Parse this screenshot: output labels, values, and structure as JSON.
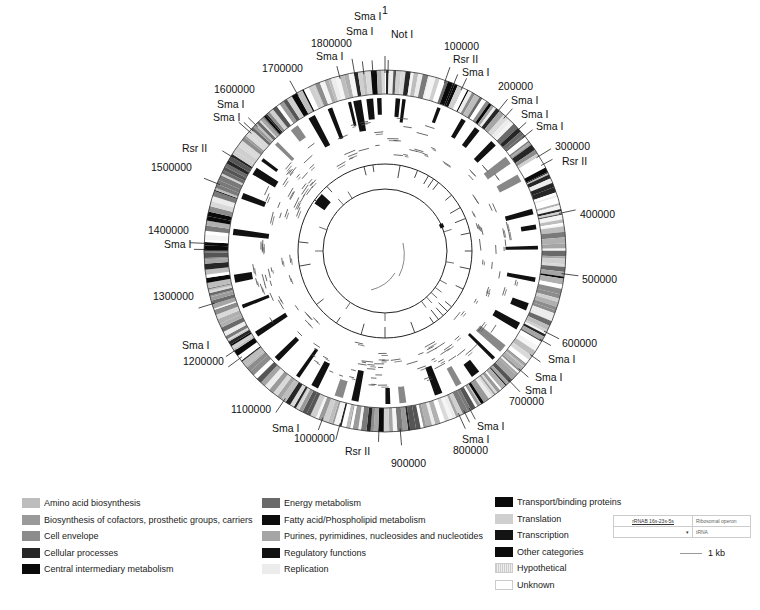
{
  "chart_data": {
    "type": "circular_genome_map",
    "genome_length_ticks": [
      "1",
      "100000",
      "200000",
      "300000",
      "400000",
      "500000",
      "600000",
      "700000",
      "800000",
      "900000",
      "1000000",
      "1100000",
      "1200000",
      "1300000",
      "1400000",
      "1500000",
      "1600000",
      "1700000",
      "1800000"
    ],
    "restriction_sites": [
      {
        "label": "Not I",
        "position": 5000
      },
      {
        "label": "Sma I",
        "position": 1830000
      },
      {
        "label": "Sma I",
        "position": 1815000
      },
      {
        "label": "Sma I",
        "position": 1775000
      },
      {
        "label": "Rsr II",
        "position": 115000
      },
      {
        "label": "Sma I",
        "position": 130000
      },
      {
        "label": "Sma I",
        "position": 215000
      },
      {
        "label": "Sma I",
        "position": 245000
      },
      {
        "label": "Sma I",
        "position": 260000
      },
      {
        "label": "Rsr II",
        "position": 315000
      },
      {
        "label": "Sma I",
        "position": 615000
      },
      {
        "label": "Sma I",
        "position": 645000
      },
      {
        "label": "Sma I",
        "position": 675000
      },
      {
        "label": "Sma I",
        "position": 790000
      },
      {
        "label": "Sma I",
        "position": 780000
      },
      {
        "label": "Rsr II",
        "position": 935000
      },
      {
        "label": "Sma I",
        "position": 1030000
      },
      {
        "label": "Sma I",
        "position": 1215000
      },
      {
        "label": "Sma I",
        "position": 1390000
      },
      {
        "label": "Rsr II",
        "position": 1550000
      },
      {
        "label": "Sma I",
        "position": 1615000
      },
      {
        "label": "Sma I",
        "position": 1605000
      }
    ],
    "rings": [
      "gene functional categories (outer)",
      "selected categories",
      "gene clusters",
      "rRNA/tRNA",
      "inner scale"
    ]
  },
  "labels": {
    "ticks": [
      {
        "text": "1",
        "x": 382,
        "y": 14
      },
      {
        "text": "100000",
        "x": 444,
        "y": 50
      },
      {
        "text": "200000",
        "x": 498,
        "y": 90
      },
      {
        "text": "300000",
        "x": 555,
        "y": 150
      },
      {
        "text": "400000",
        "x": 580,
        "y": 218
      },
      {
        "text": "500000",
        "x": 582,
        "y": 283
      },
      {
        "text": "600000",
        "x": 562,
        "y": 347
      },
      {
        "text": "700000",
        "x": 509,
        "y": 405
      },
      {
        "text": "800000",
        "x": 453,
        "y": 454
      },
      {
        "text": "900000",
        "x": 391,
        "y": 467
      },
      {
        "text": "1000000",
        "x": 294,
        "y": 442
      },
      {
        "text": "1100000",
        "x": 231,
        "y": 413
      },
      {
        "text": "1200000",
        "x": 183,
        "y": 365
      },
      {
        "text": "1300000",
        "x": 153,
        "y": 300
      },
      {
        "text": "1400000",
        "x": 148,
        "y": 234
      },
      {
        "text": "1500000",
        "x": 151,
        "y": 171
      },
      {
        "text": "1600000",
        "x": 214,
        "y": 93
      },
      {
        "text": "1700000",
        "x": 262,
        "y": 72
      },
      {
        "text": "1800000",
        "x": 311,
        "y": 47
      }
    ],
    "sites": [
      {
        "text": "Sma I",
        "x": 354,
        "y": 20
      },
      {
        "text": "Sma I",
        "x": 346,
        "y": 35
      },
      {
        "text": "Not I",
        "x": 391,
        "y": 38
      },
      {
        "text": "Sma I",
        "x": 316,
        "y": 60
      },
      {
        "text": "Rsr II",
        "x": 453,
        "y": 63
      },
      {
        "text": "Sma I",
        "x": 462,
        "y": 76
      },
      {
        "text": "Sma I",
        "x": 511,
        "y": 104
      },
      {
        "text": "Sma I",
        "x": 521,
        "y": 118
      },
      {
        "text": "Sma I",
        "x": 536,
        "y": 130
      },
      {
        "text": "Rsr II",
        "x": 562,
        "y": 165
      },
      {
        "text": "Sma I",
        "x": 164,
        "y": 248
      },
      {
        "text": "Sma I",
        "x": 182,
        "y": 349
      },
      {
        "text": "Sma I",
        "x": 548,
        "y": 363
      },
      {
        "text": "Sma I",
        "x": 535,
        "y": 381
      },
      {
        "text": "Sma I",
        "x": 525,
        "y": 394
      },
      {
        "text": "Sma I",
        "x": 477,
        "y": 430
      },
      {
        "text": "Sma I",
        "x": 462,
        "y": 443
      },
      {
        "text": "Rsr II",
        "x": 345,
        "y": 455
      },
      {
        "text": "Sma I",
        "x": 272,
        "y": 432
      },
      {
        "text": "Rsr II",
        "x": 182,
        "y": 152
      },
      {
        "text": "Sma I",
        "x": 217,
        "y": 108
      },
      {
        "text": "Sma I",
        "x": 213,
        "y": 121
      }
    ]
  },
  "legend": {
    "col1": [
      {
        "label": "Amino acid biosynthesis",
        "color": "#bdbdbd"
      },
      {
        "label": "Biosynthesis of cofactors, prosthetic groups, carriers",
        "color": "#9a9a9a"
      },
      {
        "label": "Cell envelope",
        "color": "#8c8c8c"
      },
      {
        "label": "Cellular processes",
        "color": "#262626"
      },
      {
        "label": "Central intermediary metabolism",
        "color": "#0a0a0a"
      }
    ],
    "col2": [
      {
        "label": "Energy metabolism",
        "color": "#6a6a6a"
      },
      {
        "label": "Fatty acid/Phospholipid metabolism",
        "color": "#0c0c0c"
      },
      {
        "label": "Purines, pyrimidines, nucleosides and nucleotides",
        "color": "#a5a5a5"
      },
      {
        "label": "Regulatory functions",
        "color": "#111111"
      },
      {
        "label": "Replication",
        "color": "#ececec"
      }
    ],
    "col3": [
      {
        "label": "Transport/binding proteins",
        "color": "#0a0a0a"
      },
      {
        "label": "Translation",
        "color": "#cfcfcf"
      },
      {
        "label": "Transcription",
        "color": "#141414"
      },
      {
        "label": "Other categories",
        "color": "#0a0a0a"
      },
      {
        "label": "Hypothetical",
        "color": "hatch"
      },
      {
        "label": "Unknown",
        "color": "outline"
      }
    ]
  },
  "key": {
    "rows": [
      {
        "symbol": "rRNAB 16s-23s-5s",
        "label": "Ribosomal operon"
      },
      {
        "symbol": "▾",
        "label": "tRNA"
      }
    ],
    "scale": "1 kb"
  }
}
